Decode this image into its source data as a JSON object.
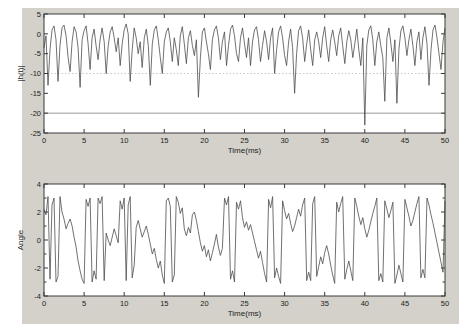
{
  "figure": {
    "page_background": "#ffffff",
    "figure_background": "#d3d1c9",
    "frame_color": "#3a3a3a",
    "tick_label_color": "#222222"
  },
  "chart_data": [
    {
      "name": "magnitude",
      "type": "line",
      "title": "",
      "xlabel": "Time(ms)",
      "ylabel": "|h(t)|",
      "xlim": [
        0,
        50
      ],
      "ylim": [
        -25,
        5
      ],
      "xticks": [
        0,
        5,
        10,
        15,
        20,
        25,
        30,
        35,
        40,
        45,
        50
      ],
      "yticks": [
        5,
        0,
        -5,
        -10,
        -15,
        -20,
        -25
      ],
      "grid": "off",
      "legend": "none",
      "line_color": "#4d4d4d",
      "hlines": [
        {
          "y": -10,
          "style": "dotted",
          "color": "#c9c9c9"
        },
        {
          "y": -20,
          "style": "solid",
          "color": "#9a9a9a"
        }
      ],
      "x_start": 0,
      "x_step": 0.25,
      "values": [
        -3.5,
        -0.5,
        -13,
        -4,
        1,
        2,
        -1.5,
        -12,
        -3,
        1.5,
        2.2,
        -0.5,
        -6,
        -9.5,
        -2,
        1.8,
        0.5,
        -3.5,
        -13.5,
        -1.5,
        0.8,
        2,
        -2.5,
        -9,
        -1,
        1.2,
        -3,
        -6.5,
        -1.5,
        1.5,
        -2,
        -10,
        -3,
        0.5,
        1.8,
        -1,
        -4.5,
        -1,
        -8,
        -2.5,
        1,
        2.5,
        0,
        -12,
        -4,
        1.5,
        -1,
        -5,
        -2,
        -8.5,
        -1,
        1.2,
        -3,
        -13,
        -2.5,
        1,
        2,
        -1.5,
        -6,
        -10,
        -2,
        0.5,
        1.5,
        -2,
        -7,
        -1,
        -4,
        -8,
        -0.5,
        1.8,
        -2.5,
        -7.5,
        -1,
        0.8,
        -3,
        -5.5,
        -1.5,
        -16,
        -6,
        0.5,
        1.5,
        -2,
        -5,
        -9,
        -1.5,
        1,
        2,
        -1,
        -6.5,
        -2,
        0.5,
        -8,
        -3,
        1.2,
        2.2,
        -0.5,
        -5,
        -7,
        -1,
        1.5,
        -2.5,
        -6,
        -1,
        -8,
        -2,
        1,
        1.8,
        -1.5,
        -7,
        -3,
        0.8,
        -2,
        -6.5,
        -1,
        1.5,
        -10,
        -4,
        0.5,
        2,
        -1,
        -5.5,
        -8,
        -2,
        1.2,
        -3.5,
        -15,
        -5,
        0.8,
        2,
        -1,
        -7,
        -2.5,
        1,
        -4,
        -8,
        -1.5,
        0.5,
        -2,
        -6,
        -1,
        1.8,
        -3,
        -7,
        -1.5,
        1,
        -2,
        -5.5,
        -0.5,
        1.5,
        -3,
        -7.5,
        -2,
        0.8,
        -1.5,
        -6,
        -2.5,
        1.2,
        -4,
        -8,
        -1,
        -23,
        -3,
        1,
        2,
        -1.5,
        -8,
        -2,
        0.5,
        -3,
        -6,
        -17,
        -1,
        1.5,
        -2.5,
        -7,
        -1.5,
        -17.5,
        -4,
        0.8,
        2,
        -1,
        -5.5,
        -1.5,
        1.2,
        -3,
        -8,
        -2,
        0.5,
        -6.5,
        -1,
        1.8,
        -2.5,
        -13,
        -4,
        1,
        2.2,
        -1,
        -5,
        -9,
        -2,
        1.5
      ]
    },
    {
      "name": "phase",
      "type": "line",
      "title": "",
      "xlabel": "Time(ms)",
      "ylabel": "Angle",
      "xlim": [
        0,
        50
      ],
      "ylim": [
        -4,
        4
      ],
      "xticks": [
        0,
        5,
        10,
        15,
        20,
        25,
        30,
        35,
        40,
        45,
        50
      ],
      "yticks": [
        4,
        2,
        0,
        -2,
        -4
      ],
      "yticks_minor": [
        3,
        1,
        -1,
        -3
      ],
      "grid": "off",
      "legend": "none",
      "line_color": "#4d4d4d",
      "x_start": 0,
      "x_step": 0.25,
      "values": [
        2.2,
        1.8,
        3.1,
        -2.8,
        2.5,
        3.0,
        -3.0,
        -2.6,
        3.1,
        2.0,
        1.5,
        0.8,
        1.2,
        1.5,
        1.0,
        0.2,
        -0.5,
        -1.5,
        -2.2,
        -2.8,
        -3.1,
        2.9,
        2.4,
        3.0,
        -3.0,
        -2.2,
        -2.8,
        3.0,
        2.6,
        3.1,
        -2.9,
        0.5,
        0.0,
        -0.4,
        0.2,
        0.8,
        0.3,
        -0.2,
        2.8,
        2.2,
        3.0,
        -2.9,
        2.5,
        3.1,
        -2.7,
        -1.8,
        0.9,
        1.4,
        0.8,
        0.2,
        0.6,
        1.0,
        0.4,
        -0.3,
        -1.0,
        -0.6,
        -1.4,
        -2.0,
        -1.5,
        -2.5,
        -3.1,
        2.8,
        3.0,
        2.4,
        -3.0,
        -2.5,
        3.1,
        2.7,
        1.9,
        2.3,
        0.8,
        0.3,
        0.9,
        0.5,
        1.8,
        2.0,
        1.4,
        0.6,
        -0.2,
        -0.8,
        -0.4,
        -1.2,
        -0.7,
        -1.5,
        -0.9,
        -0.3,
        0.4,
        -0.5,
        -1.1,
        -0.6,
        3.0,
        2.5,
        3.1,
        -2.8,
        -2.2,
        -3.0,
        2.7,
        2.2,
        2.8,
        1.6,
        0.9,
        1.3,
        0.7,
        1.1,
        0.5,
        -0.1,
        -0.7,
        -1.3,
        -0.8,
        -1.6,
        -2.4,
        -3.0,
        2.9,
        2.3,
        3.1,
        -2.7,
        -2.0,
        -2.6,
        -3.1,
        2.8,
        2.1,
        1.5,
        1.9,
        1.2,
        0.6,
        1.0,
        1.6,
        2.2,
        1.7,
        2.5,
        3.0,
        -2.9,
        -2.3,
        -2.9,
        2.6,
        3.1,
        -2.6,
        -1.9,
        -1.2,
        -1.7,
        -0.9,
        -0.4,
        -1.0,
        -1.8,
        -2.5,
        -3.1,
        2.7,
        2.0,
        2.6,
        3.1,
        -2.8,
        -2.1,
        -1.5,
        -2.2,
        -2.9,
        3.0,
        2.4,
        1.7,
        1.1,
        1.6,
        0.8,
        0.2,
        0.7,
        1.3,
        1.9,
        2.4,
        3.0,
        -2.9,
        -2.4,
        -3.0,
        2.8,
        2.2,
        1.6,
        2.1,
        2.7,
        -3.1,
        -2.5,
        -1.8,
        -2.4,
        -3.0,
        2.9,
        2.3,
        1.7,
        1.0,
        1.4,
        2.0,
        2.6,
        3.1,
        -2.7,
        -2.1,
        -2.7,
        3.0,
        2.5,
        1.8,
        1.2,
        0.5,
        -0.2,
        -0.9,
        -1.6,
        -2.3,
        2.8
      ]
    }
  ]
}
